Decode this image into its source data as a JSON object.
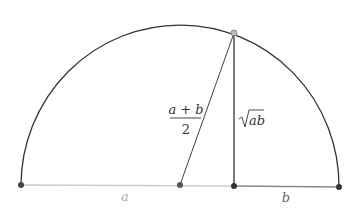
{
  "diagram": {
    "labels": {
      "a": "a",
      "b": "b",
      "mean_numerator": "a + b",
      "mean_denominator": "2",
      "sqrt_arg": "ab"
    },
    "points": {
      "left_end": [
        21,
        185
      ],
      "center": [
        180,
        185
      ],
      "foot": [
        234,
        186
      ],
      "right_end": [
        339,
        187
      ],
      "top": [
        234,
        33
      ]
    },
    "colors": {
      "arc": "#333333",
      "segment_a": "#cccccc",
      "segment_b": "#888888",
      "point": "#444444",
      "top_point": "#999999",
      "label_a": "#aaaaaa",
      "label_b": "#666666",
      "text": "#333333"
    }
  }
}
